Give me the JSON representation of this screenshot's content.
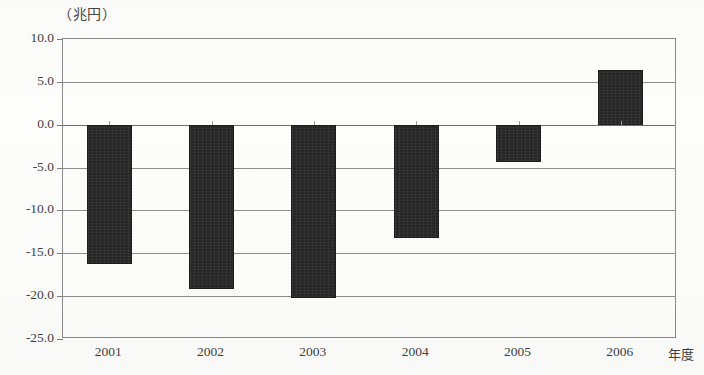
{
  "chart_data": {
    "type": "bar",
    "title": "",
    "subtitle": "",
    "unit_label": "（兆円）",
    "xlabel": "年度",
    "ylabel": "",
    "categories": [
      "2001",
      "2002",
      "2003",
      "2004",
      "2005",
      "2006"
    ],
    "values": [
      -16.3,
      -19.2,
      -20.2,
      -13.2,
      -4.4,
      6.4
    ],
    "series": [
      {
        "name": "",
        "values": [
          -16.3,
          -19.2,
          -20.2,
          -13.2,
          -4.4,
          6.4
        ]
      }
    ],
    "ylim": [
      -25.0,
      10.0
    ],
    "ytick_labels": [
      "10.0",
      "5.0",
      "0.0",
      "-5.0",
      "-10.0",
      "-15.0",
      "-20.0",
      "-25.0"
    ],
    "ytick_values": [
      10.0,
      5.0,
      0.0,
      -5.0,
      -10.0,
      -15.0,
      -20.0,
      -25.0
    ],
    "grid": true,
    "legend": "none",
    "bar_color": "#262626",
    "axis_color": "#8a8a8a",
    "background_color": "#fdfdfc"
  },
  "axis": {
    "unit_label": "（兆円）",
    "x_axis_title": "年度"
  },
  "ylabels": [
    {
      "text": "10.0",
      "value": 10.0
    },
    {
      "text": "5.0",
      "value": 5.0
    },
    {
      "text": "0.0",
      "value": 0.0
    },
    {
      "text": "-5.0",
      "value": -5.0
    },
    {
      "text": "-10.0",
      "value": -10.0
    },
    {
      "text": "-15.0",
      "value": -15.0
    },
    {
      "text": "-20.0",
      "value": -20.0
    },
    {
      "text": "-25.0",
      "value": -25.0
    }
  ],
  "xlabels": [
    {
      "text": "2001"
    },
    {
      "text": "2002"
    },
    {
      "text": "2003"
    },
    {
      "text": "2004"
    },
    {
      "text": "2005"
    },
    {
      "text": "2006"
    }
  ],
  "bars": [
    {
      "category": "2001",
      "value": -16.3
    },
    {
      "category": "2002",
      "value": -19.2
    },
    {
      "category": "2003",
      "value": -20.2
    },
    {
      "category": "2004",
      "value": -13.2
    },
    {
      "category": "2005",
      "value": -4.4
    },
    {
      "category": "2006",
      "value": 6.4
    }
  ]
}
